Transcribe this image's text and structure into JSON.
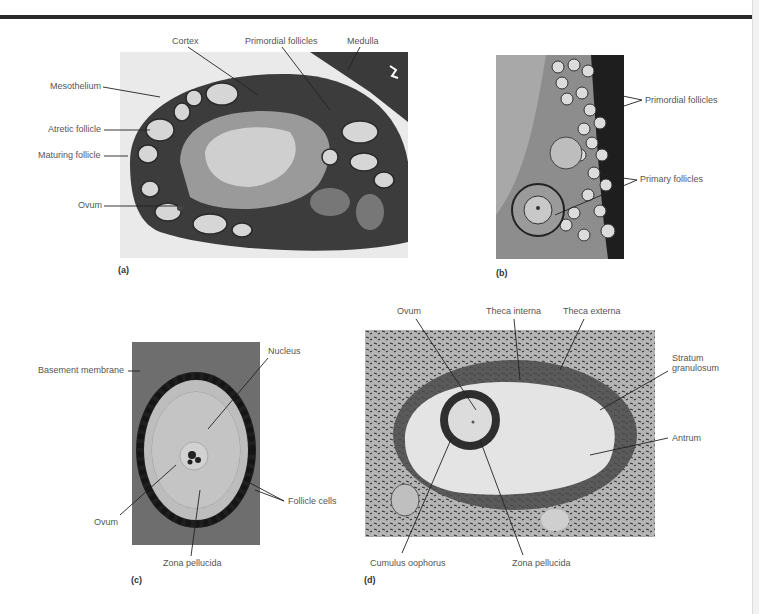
{
  "figure": {
    "panels": [
      {
        "id": "a",
        "label": "(a)",
        "labels": {
          "cortex": "Cortex",
          "primordial_follicles": "Primordial follicles",
          "medulla": "Medulla",
          "mesothelium": "Mesothelium",
          "atretic_follicle": "Atretic follicle",
          "maturing_follicle": "Maturing follicle",
          "ovum": "Ovum"
        }
      },
      {
        "id": "b",
        "label": "(b)",
        "labels": {
          "primordial_follicles": "Primordial follicles",
          "primary_follicles": "Primary follicles"
        }
      },
      {
        "id": "c",
        "label": "(c)",
        "labels": {
          "nucleus": "Nucleus",
          "basement_membrane": "Basement membrane",
          "follicle_cells": "Follicle cells",
          "ovum": "Ovum",
          "zona_pellucida": "Zona pellucida"
        }
      },
      {
        "id": "d",
        "label": "(d)",
        "labels": {
          "ovum": "Ovum",
          "theca_interna": "Theca interna",
          "theca_externa": "Theca externa",
          "stratum_granulosum": "Stratum granulosum",
          "antrum": "Antrum",
          "cumulus_oophorus": "Cumulus oophorus",
          "zona_pellucida": "Zona pellucida"
        }
      }
    ],
    "colors": {
      "rule": "#2a2a2a",
      "label_text": "#555555",
      "tissue_dark": "#2b2b2b",
      "tissue_mid": "#7a7a7a",
      "tissue_light": "#d8d8d8"
    }
  }
}
